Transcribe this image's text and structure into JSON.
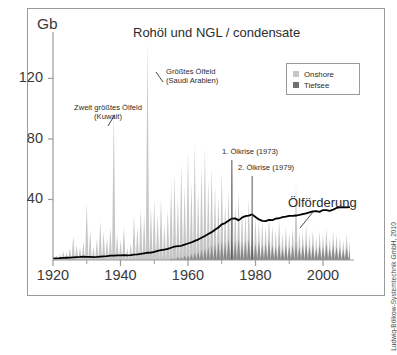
{
  "chart_data": {
    "type": "area",
    "title": "Rohöl und NGL / condensate",
    "xlabel": "",
    "ylabel": "Gb",
    "y_unit_label": "Gb",
    "xlim": [
      1920,
      2008
    ],
    "ylim": [
      0,
      152
    ],
    "yticks": [
      40,
      80,
      120
    ],
    "ytick_labels": [
      "40",
      "80",
      "120"
    ],
    "xticks": [
      1920,
      1940,
      1960,
      1980,
      2000
    ],
    "xtick_labels": [
      "1920",
      "1940",
      "1960",
      "1980",
      "2000"
    ],
    "xminor_ticks": [
      1930,
      1950,
      1970,
      1990
    ],
    "grid": false,
    "legend_position": "top-right",
    "stacked": true,
    "legend": [
      "Onshore",
      "Tiefsee"
    ],
    "colors": {
      "onshore": "#c6c6c6",
      "tiefsee": "#8a8a8a",
      "production_line": "#000000",
      "axis": "#9b9b9b",
      "text": "#2b2b2b",
      "frame": "#9b9b9b",
      "background": "#ffffff"
    },
    "x": [
      1920,
      1921,
      1922,
      1923,
      1924,
      1925,
      1926,
      1927,
      1928,
      1929,
      1930,
      1931,
      1932,
      1933,
      1934,
      1935,
      1936,
      1937,
      1938,
      1939,
      1940,
      1941,
      1942,
      1943,
      1944,
      1945,
      1946,
      1947,
      1948,
      1949,
      1950,
      1951,
      1952,
      1953,
      1954,
      1955,
      1956,
      1957,
      1958,
      1959,
      1960,
      1961,
      1962,
      1963,
      1964,
      1965,
      1966,
      1967,
      1968,
      1969,
      1970,
      1971,
      1972,
      1973,
      1974,
      1975,
      1976,
      1977,
      1978,
      1979,
      1980,
      1981,
      1982,
      1983,
      1984,
      1985,
      1986,
      1987,
      1988,
      1989,
      1990,
      1991,
      1992,
      1993,
      1994,
      1995,
      1996,
      1997,
      1998,
      1999,
      2000,
      2001,
      2002,
      2003,
      2004,
      2005,
      2006,
      2007,
      2008
    ],
    "series": [
      {
        "name": "Onshore",
        "values": [
          2,
          3,
          4,
          6,
          5,
          8,
          16,
          10,
          9,
          12,
          38,
          20,
          9,
          14,
          26,
          19,
          15,
          22,
          100,
          17,
          13,
          22,
          8,
          11,
          30,
          22,
          34,
          30,
          145,
          36,
          40,
          30,
          41,
          24,
          33,
          50,
          56,
          40,
          62,
          45,
          70,
          48,
          72,
          40,
          55,
          66,
          44,
          52,
          38,
          30,
          46,
          26,
          32,
          54,
          24,
          30,
          22,
          18,
          26,
          20,
          18,
          14,
          16,
          12,
          17,
          13,
          11,
          16,
          10,
          12,
          9,
          11,
          38,
          10,
          9,
          12,
          8,
          10,
          7,
          9,
          8,
          10,
          7,
          9,
          8,
          7,
          6,
          8,
          6
        ]
      },
      {
        "name": "Tiefsee",
        "values": [
          0,
          0,
          0,
          0,
          0,
          0,
          0,
          0,
          0,
          0,
          0,
          0,
          0,
          0,
          0,
          0,
          0,
          0,
          0,
          0,
          0,
          0,
          0,
          0,
          0,
          0,
          0,
          0,
          0,
          0,
          0,
          0,
          0,
          0,
          0,
          1,
          1,
          2,
          2,
          3,
          3,
          4,
          5,
          6,
          7,
          8,
          9,
          10,
          11,
          12,
          13,
          12,
          14,
          15,
          13,
          14,
          12,
          13,
          14,
          12,
          11,
          12,
          10,
          11,
          13,
          10,
          9,
          11,
          8,
          10,
          9,
          10,
          12,
          9,
          10,
          11,
          9,
          10,
          8,
          10,
          9,
          11,
          8,
          10,
          9,
          8,
          7,
          9,
          7
        ]
      }
    ],
    "production_line": {
      "name": "Ölförderung",
      "values": [
        1.0,
        1.1,
        1.2,
        1.4,
        1.5,
        1.6,
        1.8,
        1.9,
        2.0,
        2.2,
        2.1,
        2.0,
        1.9,
        2.0,
        2.2,
        2.4,
        2.6,
        2.9,
        2.9,
        3.0,
        3.1,
        3.2,
        3.0,
        3.2,
        3.5,
        3.7,
        4.0,
        4.4,
        4.8,
        4.9,
        5.4,
        6.1,
        6.5,
        6.9,
        7.3,
        8.1,
        8.8,
        9.2,
        9.4,
        10.2,
        10.9,
        11.6,
        12.6,
        13.5,
        14.7,
        15.9,
        17.2,
        18.4,
        20.0,
        21.5,
        23.5,
        24.4,
        25.9,
        27.4,
        27.5,
        26.2,
        28.0,
        29.0,
        29.3,
        30.1,
        28.4,
        26.8,
        25.9,
        25.7,
        26.5,
        26.3,
        27.3,
        27.6,
        28.3,
        28.6,
        29.2,
        29.1,
        29.4,
        29.8,
        30.3,
        30.8,
        31.5,
        32.2,
        32.3,
        31.8,
        33.0,
        32.9,
        32.5,
        33.3,
        34.4,
        34.8,
        34.9,
        34.8,
        35.0
      ]
    },
    "annotations": [
      {
        "id": "kuwait",
        "lines": [
          "Zweit größtes Ölfeld",
          "(Kuwait)"
        ],
        "text": "Zweit größtes Ölfeld (Kuwait)",
        "points_to_year": 1938,
        "points_to_value": 100
      },
      {
        "id": "saudi",
        "lines": [
          "Größtes Ölfeld",
          "(Saudi Arabien)"
        ],
        "text": "Größtes Ölfeld (Saudi Arabien)",
        "points_to_year": 1948,
        "points_to_value": 145
      },
      {
        "id": "oelkrise-1",
        "lines": [
          "1. Ölkrise (1973)"
        ],
        "text": "1. Ölkrise (1973)",
        "points_to_year": 1973,
        "marker": true
      },
      {
        "id": "oelkrise-2",
        "lines": [
          "2. Ölkrise (1979)"
        ],
        "text": "2. Ölkrise (1979)",
        "points_to_year": 1979,
        "marker": true
      },
      {
        "id": "produktion",
        "lines": [
          "Ölförderung"
        ],
        "text": "Ölförderung",
        "points_to_year": 1996
      }
    ],
    "credit": "Ludwig-Bölkow-Systemtechnik GmbH, 2010"
  }
}
